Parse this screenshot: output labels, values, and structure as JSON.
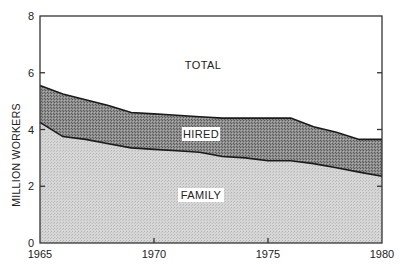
{
  "chart_data": {
    "type": "area",
    "stacked": true,
    "title": "",
    "xlabel": "",
    "ylabel": "MILLION WORKERS",
    "x": [
      1965,
      1966,
      1967,
      1968,
      1969,
      1970,
      1971,
      1972,
      1973,
      1974,
      1975,
      1976,
      1977,
      1978,
      1979,
      1980
    ],
    "series": [
      {
        "name": "FAMILY",
        "values": [
          4.25,
          3.75,
          3.65,
          3.5,
          3.35,
          3.3,
          3.25,
          3.2,
          3.05,
          3.0,
          2.9,
          2.9,
          2.8,
          2.65,
          2.5,
          2.35
        ]
      },
      {
        "name": "TOTAL",
        "values": [
          5.55,
          5.25,
          5.05,
          4.85,
          4.6,
          4.55,
          4.5,
          4.45,
          4.4,
          4.4,
          4.4,
          4.4,
          4.1,
          3.9,
          3.65,
          3.65
        ]
      }
    ],
    "derived_series": {
      "name": "HIRED",
      "definition": "TOTAL minus FAMILY"
    },
    "xlim": [
      1965,
      1980
    ],
    "ylim": [
      0,
      8
    ],
    "x_ticks": [
      "1965",
      "1970",
      "1975",
      "1980"
    ],
    "y_ticks": [
      "0",
      "2",
      "4",
      "6",
      "8"
    ],
    "area_labels": [
      "TOTAL",
      "HIRED",
      "FAMILY"
    ],
    "grid": false,
    "legend": "none (inline area labels)"
  },
  "colors": {
    "family_fill": "#d2d2d2",
    "hired_fill": "#8a8a8a",
    "total_fill": "#ffffff",
    "line": "#1a1a1a"
  }
}
